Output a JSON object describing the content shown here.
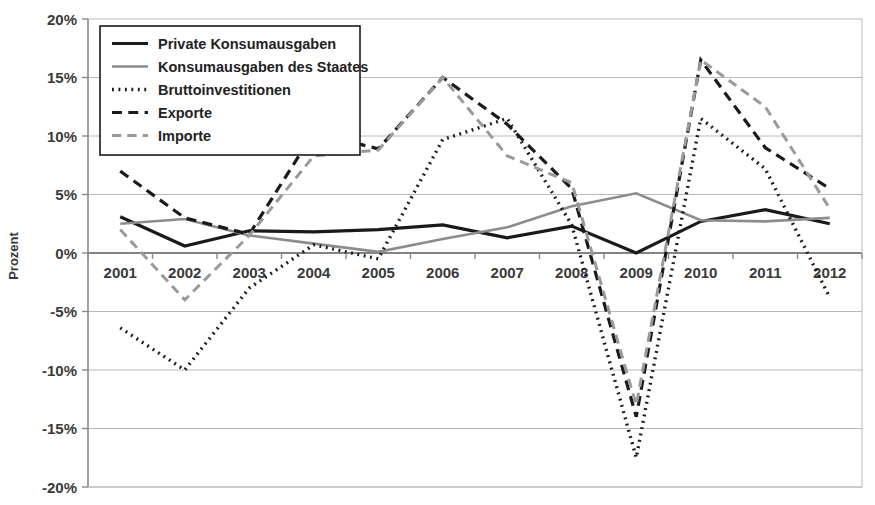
{
  "chart_data": {
    "type": "line",
    "title": "",
    "xlabel": "",
    "ylabel": "Prozent",
    "categories": [
      "2001",
      "2002",
      "2003",
      "2004",
      "2005",
      "2006",
      "2007",
      "2008",
      "2009",
      "2010",
      "2011",
      "2012"
    ],
    "x": [
      2001,
      2002,
      2003,
      2004,
      2005,
      2006,
      2007,
      2008,
      2009,
      2010,
      2011,
      2012
    ],
    "ylim": [
      -20,
      20
    ],
    "ytick_values": [
      20,
      15,
      10,
      5,
      0,
      -5,
      -10,
      -15,
      -20
    ],
    "ytick_labels": [
      "20%",
      "15%",
      "10%",
      "5%",
      "0%",
      "-5%",
      "-10%",
      "-15%",
      "-20%"
    ],
    "grid": true,
    "legend_position": "top-left",
    "series": [
      {
        "name": "Private Konsumausgaben",
        "style": "solid",
        "color": "#1a1a1a",
        "width": 3.2,
        "values": [
          3.1,
          0.6,
          1.9,
          1.8,
          2.0,
          2.4,
          1.3,
          2.3,
          0.0,
          2.7,
          3.7,
          2.5
        ]
      },
      {
        "name": "Konsumausgaben des Staates",
        "style": "solid",
        "color": "#8c8c8c",
        "width": 2.6,
        "values": [
          2.5,
          2.9,
          1.5,
          0.8,
          0.1,
          1.2,
          2.2,
          4.0,
          5.1,
          2.8,
          2.7,
          3.0
        ]
      },
      {
        "name": "Bruttoinvestitionen",
        "style": "dotted",
        "color": "#1a1a1a",
        "width": 3.4,
        "values": [
          -6.4,
          -10.0,
          -3.0,
          0.7,
          -0.5,
          9.7,
          11.5,
          2.4,
          -17.5,
          11.5,
          7.2,
          -3.8
        ]
      },
      {
        "name": "Exporte",
        "style": "dashed",
        "color": "#1a1a1a",
        "width": 3.2,
        "values": [
          7.0,
          3.0,
          1.6,
          10.3,
          8.9,
          15.0,
          11.0,
          5.5,
          -14.0,
          16.5,
          9.0,
          5.5
        ]
      },
      {
        "name": "Importe",
        "style": "dashed",
        "color": "#9a9a9a",
        "width": 3.0,
        "values": [
          2.0,
          -4.0,
          1.5,
          8.3,
          8.8,
          15.0,
          8.3,
          6.0,
          -13.0,
          16.5,
          12.5,
          3.8
        ]
      }
    ]
  },
  "legend": {
    "items": [
      {
        "label": "Private Konsumausgaben",
        "swatch": "solid-black-line-swatch"
      },
      {
        "label": "Konsumausgaben des Staates",
        "swatch": "solid-gray-line-swatch"
      },
      {
        "label": "Bruttoinvestitionen",
        "swatch": "dotted-black-line-swatch"
      },
      {
        "label": "Exporte",
        "swatch": "dashed-black-line-swatch"
      },
      {
        "label": "Importe",
        "swatch": "dashed-gray-line-swatch"
      }
    ]
  }
}
